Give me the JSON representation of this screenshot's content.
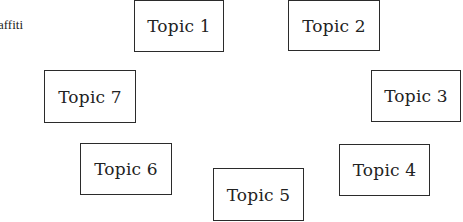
{
  "diagram": {
    "partial_label": "affiti",
    "topics": [
      {
        "label": "Topic 1",
        "x": 134,
        "y": 0,
        "w": 90,
        "h": 52
      },
      {
        "label": "Topic 2",
        "x": 288,
        "y": 0,
        "w": 92,
        "h": 51
      },
      {
        "label": "Topic 3",
        "x": 371,
        "y": 70,
        "w": 90,
        "h": 52
      },
      {
        "label": "Topic 4",
        "x": 339,
        "y": 144,
        "w": 91,
        "h": 52
      },
      {
        "label": "Topic 5",
        "x": 213,
        "y": 168,
        "w": 91,
        "h": 53
      },
      {
        "label": "Topic 6",
        "x": 80,
        "y": 143,
        "w": 92,
        "h": 52
      },
      {
        "label": "Topic 7",
        "x": 44,
        "y": 70,
        "w": 92,
        "h": 53
      }
    ]
  }
}
